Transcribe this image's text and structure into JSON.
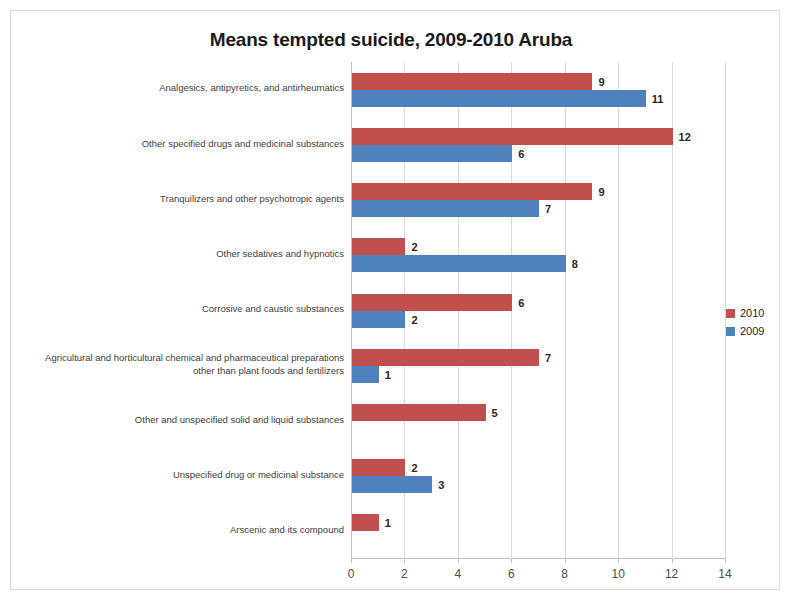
{
  "chart_data": {
    "type": "bar",
    "orientation": "horizontal",
    "title": "Means tempted suicide, 2009-2010 Aruba",
    "xlabel": "",
    "ylabel": "",
    "xlim": [
      0,
      14
    ],
    "xticks": [
      0,
      2,
      4,
      6,
      8,
      10,
      12,
      14
    ],
    "grid": true,
    "legend_position": "right",
    "categories": [
      "Analgesics, antipyretics, and antirheumatics",
      "Other specified drugs and medicinal substances",
      "Tranquilizers and other psychotropic agents",
      "Other sedatives and hypnotics",
      "Corrosive and caustic substances",
      "Agricultural and horticultural chemical and pharmaceutical preparations other than plant foods and fertilizers",
      "Other and unspecified solid and liquid substances",
      "Unspecified drug or medicinal substance",
      "Arscenic and its compound"
    ],
    "category_lines": [
      [
        "Analgesics, antipyretics, and antirheumatics"
      ],
      [
        "Other specified drugs and medicinal substances"
      ],
      [
        "Tranquilizers and other psychotropic agents"
      ],
      [
        "Other sedatives and hypnotics"
      ],
      [
        "Corrosive and caustic substances"
      ],
      [
        "Agricultural and horticultural chemical and pharmaceutical preparations",
        "other than plant foods and fertilizers"
      ],
      [
        "Other and unspecified solid and liquid substances"
      ],
      [
        "Unspecified drug or medicinal substance"
      ],
      [
        "Arscenic and its compound"
      ]
    ],
    "series": [
      {
        "name": "2010",
        "color": "#c0504d",
        "values": [
          9,
          12,
          9,
          2,
          6,
          7,
          5,
          2,
          1
        ]
      },
      {
        "name": "2009",
        "color": "#4f81bd",
        "values": [
          11,
          6,
          7,
          8,
          2,
          1,
          null,
          3,
          null
        ]
      }
    ]
  },
  "legend": {
    "items": [
      {
        "label": "2010",
        "color": "#c0504d"
      },
      {
        "label": "2009",
        "color": "#4f81bd"
      }
    ]
  }
}
